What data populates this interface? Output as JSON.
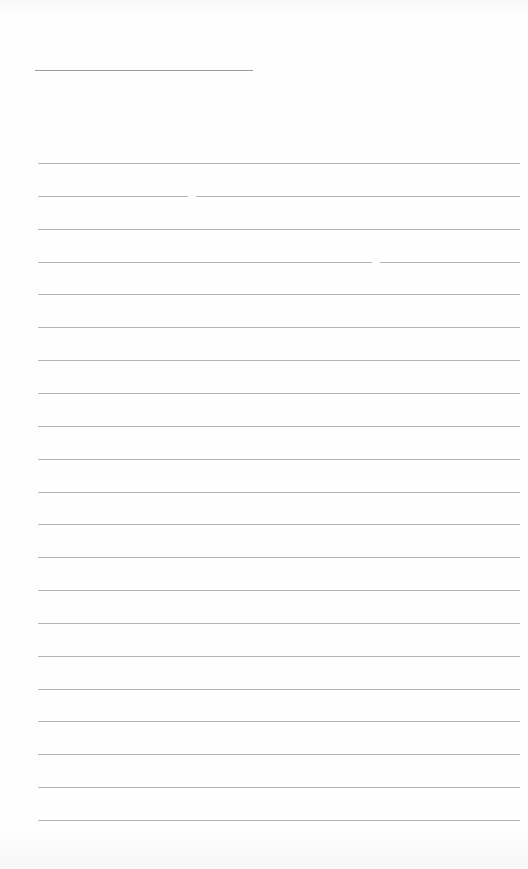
{
  "document": {
    "type": "blank ruled sheet",
    "background_color": "#fefefe",
    "line_color": "#b4b4b4",
    "title_line": {
      "x_start": 35,
      "x_end": 253,
      "y": 70,
      "color": "#9a9a9a"
    },
    "ruled_lines": {
      "count": 21,
      "x_start": 38,
      "x_end": 520,
      "y_first": 163,
      "spacing": 32.85,
      "gaps": [
        {
          "line_index": 1,
          "gap_x_start": 188,
          "gap_x_end": 196
        },
        {
          "line_index": 3,
          "gap_x_start": 372,
          "gap_x_end": 380
        }
      ]
    }
  }
}
